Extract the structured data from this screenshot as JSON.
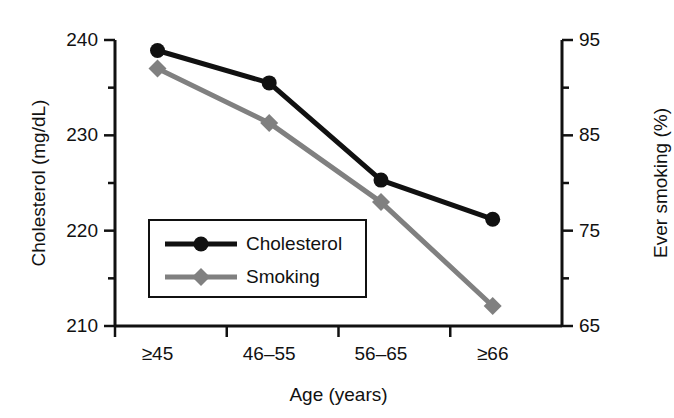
{
  "chart_data": {
    "type": "line",
    "title": "",
    "xlabel": "Age (years)",
    "categories": [
      "≥45",
      "46–55",
      "56–65",
      "≥66"
    ],
    "grid": false,
    "legend_position": "inside-lower-left",
    "axes": {
      "left": {
        "label": "Cholesterol (mg/dL)",
        "ticks": [
          "240",
          "230",
          "220",
          "210"
        ],
        "tick_values": [
          240,
          230,
          220,
          210
        ],
        "minor_tick_values": [
          235,
          225,
          215
        ],
        "ylim": [
          210,
          240
        ]
      },
      "right": {
        "label": "Ever smoking (%)",
        "ticks": [
          "95",
          "85",
          "75",
          "65"
        ],
        "tick_values": [
          95,
          85,
          75,
          65
        ],
        "minor_tick_values": [
          90,
          80,
          70
        ],
        "ylim": [
          65,
          95
        ]
      }
    },
    "series": [
      {
        "name": "Cholesterol",
        "axis": "left",
        "color": "#111111",
        "marker": "circle",
        "values": [
          238.9,
          235.5,
          225.3,
          221.2
        ]
      },
      {
        "name": "Smoking",
        "axis": "right",
        "color": "#808080",
        "marker": "diamond",
        "values": [
          92.0,
          86.3,
          78.0,
          67.1
        ]
      }
    ]
  },
  "legend": {
    "entries": [
      {
        "label": "Cholesterol"
      },
      {
        "label": "Smoking"
      }
    ]
  },
  "colors": {
    "cholesterol": "#111111",
    "smoking": "#808080",
    "axis": "#111111",
    "background": "#ffffff"
  }
}
